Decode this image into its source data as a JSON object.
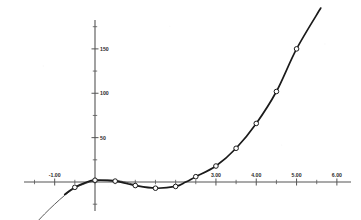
{
  "chart_data": {
    "type": "line",
    "title": "",
    "subtitle": "",
    "xlabel": "",
    "ylabel": "",
    "xlim": [
      -1.6,
      6.35
    ],
    "ylim": [
      -40,
      205
    ],
    "grid": false,
    "legend_position": "none",
    "x_tick_labels": [
      "-1.00",
      "3.00",
      "4.00",
      "5.00",
      "6.00"
    ],
    "x_tick_values": [
      -1.0,
      3.0,
      4.0,
      5.0,
      6.0
    ],
    "x_minor_tick_values": [
      -1.5,
      -1.0,
      -0.5,
      0.0,
      0.5,
      1.0,
      1.5,
      2.0,
      2.5,
      3.0,
      3.5,
      4.0,
      4.5,
      5.0,
      5.5,
      6.0
    ],
    "y_tick_labels": [
      "50",
      "100",
      "150"
    ],
    "y_tick_values": [
      50,
      100,
      150
    ],
    "y_minor_tick_values": [
      -25,
      0,
      25,
      50,
      75,
      100,
      125,
      150,
      175,
      200
    ],
    "series": [
      {
        "name": "data-points-curve",
        "style": "line-with-open-circle-markers",
        "color": "#1a1a1a",
        "x": [
          -0.75,
          -0.5,
          -0.25,
          0.0,
          0.5,
          1.0,
          1.5,
          2.0,
          2.25,
          2.5,
          3.0,
          3.5,
          4.0,
          4.5,
          5.0,
          5.6
        ],
        "y": [
          -14,
          -6,
          -1,
          2,
          1,
          -4,
          -7,
          -5,
          0,
          6,
          18,
          38,
          66,
          102,
          150,
          196
        ],
        "marker_x": [
          -0.5,
          0.0,
          0.5,
          1.0,
          1.5,
          2.0,
          2.5,
          3.0,
          3.5,
          4.0,
          4.5,
          5.0
        ],
        "marker_y": [
          -6,
          2,
          1,
          -4,
          -7,
          -5,
          6,
          18,
          38,
          66,
          102,
          150
        ]
      },
      {
        "name": "fitted-curve",
        "style": "thin-line",
        "color": "#4a4a4a",
        "x": [
          -1.5,
          -1.25,
          -1.0,
          -0.75,
          -0.5,
          -0.25,
          0.0,
          0.5,
          1.0
        ],
        "y": [
          -48,
          -36,
          -25,
          -15,
          -7,
          -2,
          1,
          2,
          -3
        ]
      }
    ],
    "annotations": []
  },
  "axes": {
    "x_axis_name": "x-axis",
    "y_axis_name": "y-axis",
    "axis_color": "#4d4d4d"
  }
}
